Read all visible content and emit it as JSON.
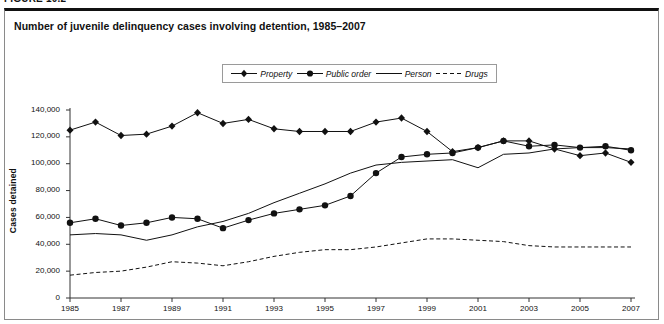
{
  "figure": {
    "caption_prefix": "FIGURE 10.2",
    "title": "Number of juvenile delinquency cases involving detention, 1985–2007"
  },
  "legend": {
    "items": [
      {
        "label": "Property",
        "marker": "diamond-marker-icon",
        "style": "solid",
        "color": "#111111"
      },
      {
        "label": "Public order",
        "marker": "circle-marker-icon",
        "style": "solid",
        "color": "#111111"
      },
      {
        "label": "Person",
        "marker": "line-only",
        "style": "solid",
        "color": "#111111"
      },
      {
        "label": "Drugs",
        "marker": "line-only",
        "style": "dashed",
        "color": "#111111"
      }
    ]
  },
  "chart_data": {
    "type": "line",
    "title": "Number of juvenile delinquency cases involving detention, 1985–2007",
    "xlabel": "",
    "ylabel": "Cases detained",
    "grid": false,
    "legend_position": "top-center",
    "x": [
      1985,
      1986,
      1987,
      1988,
      1989,
      1990,
      1991,
      1992,
      1993,
      1994,
      1995,
      1996,
      1997,
      1998,
      1999,
      2000,
      2001,
      2002,
      2003,
      2004,
      2005,
      2006,
      2007
    ],
    "xlim": [
      1985,
      2007
    ],
    "ylim": [
      0,
      140000
    ],
    "ytick_labels": [
      "0",
      "20,000",
      "40,000",
      "60,000",
      "80,000",
      "100,000",
      "120,000",
      "140,000"
    ],
    "yticks": [
      0,
      20000,
      40000,
      60000,
      80000,
      100000,
      120000,
      140000
    ],
    "xtick_labels": [
      "1985",
      "1987",
      "1989",
      "1991",
      "1993",
      "1995",
      "1997",
      "1999",
      "2001",
      "2003",
      "2005",
      "2007"
    ],
    "xticks": [
      1985,
      1987,
      1989,
      1991,
      1993,
      1995,
      1997,
      1999,
      2001,
      2003,
      2005,
      2007
    ],
    "series": [
      {
        "name": "Property",
        "marker": "diamond",
        "style": "solid",
        "values": [
          125000,
          131000,
          121000,
          122000,
          128000,
          138000,
          130000,
          133000,
          126000,
          124000,
          124000,
          124000,
          131000,
          134000,
          124000,
          109000,
          112000,
          117000,
          117000,
          111000,
          106000,
          108000,
          101000
        ]
      },
      {
        "name": "Public order",
        "marker": "circle",
        "style": "solid",
        "values": [
          56000,
          59000,
          54000,
          56000,
          60000,
          59000,
          52000,
          58000,
          63000,
          66000,
          69000,
          76000,
          93000,
          105000,
          107000,
          108000,
          112000,
          117000,
          113000,
          114000,
          112000,
          113000,
          110000
        ]
      },
      {
        "name": "Person",
        "marker": "none",
        "style": "solid",
        "values": [
          47000,
          48000,
          47000,
          43000,
          47000,
          53000,
          57000,
          63000,
          71000,
          78000,
          85000,
          93000,
          99000,
          101000,
          102000,
          103000,
          97000,
          107000,
          108000,
          111000,
          112000,
          112000,
          111000
        ]
      },
      {
        "name": "Drugs",
        "marker": "none",
        "style": "dashed",
        "values": [
          17000,
          19000,
          20000,
          23000,
          27000,
          26000,
          24000,
          27000,
          31000,
          34000,
          36000,
          36000,
          38000,
          41000,
          44000,
          44000,
          43000,
          42000,
          39000,
          38000,
          38000,
          38000,
          38000
        ]
      }
    ]
  }
}
